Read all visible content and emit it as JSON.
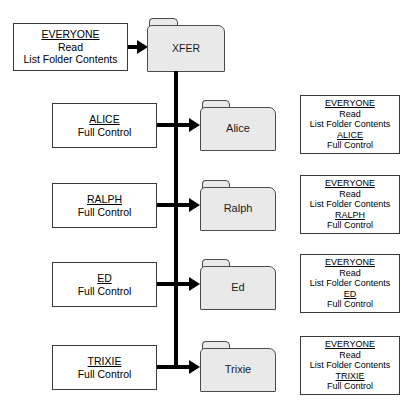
{
  "diagram": {
    "root": {
      "folder_label": "XFER",
      "permissions": {
        "lines": [
          {
            "text": "EVERYONE",
            "underline": true
          },
          {
            "text": "Read",
            "underline": false
          },
          {
            "text": "List Folder Contents",
            "underline": false
          }
        ]
      }
    },
    "rows": [
      {
        "folder_label": "Alice",
        "assigned": {
          "lines": [
            {
              "text": "ALICE",
              "underline": true
            },
            {
              "text": "Full Control",
              "underline": false
            }
          ]
        },
        "effective": {
          "lines": [
            {
              "text": "EVERYONE",
              "underline": true
            },
            {
              "text": "Read",
              "underline": false
            },
            {
              "text": "List Folder Contents",
              "underline": false
            },
            {
              "text": "ALICE",
              "underline": true
            },
            {
              "text": "Full Control",
              "underline": false
            }
          ]
        }
      },
      {
        "folder_label": "Ralph",
        "assigned": {
          "lines": [
            {
              "text": "RALPH",
              "underline": true
            },
            {
              "text": "Full Control",
              "underline": false
            }
          ]
        },
        "effective": {
          "lines": [
            {
              "text": "EVERYONE",
              "underline": true
            },
            {
              "text": "Read",
              "underline": false
            },
            {
              "text": "List Folder Contents",
              "underline": false
            },
            {
              "text": "RALPH",
              "underline": true
            },
            {
              "text": "Full Control",
              "underline": false
            }
          ]
        }
      },
      {
        "folder_label": "Ed",
        "assigned": {
          "lines": [
            {
              "text": "ED",
              "underline": true
            },
            {
              "text": "Full Control",
              "underline": false
            }
          ]
        },
        "effective": {
          "lines": [
            {
              "text": "EVERYONE",
              "underline": true
            },
            {
              "text": "Read",
              "underline": false
            },
            {
              "text": "List Folder Contents",
              "underline": false
            },
            {
              "text": "ED",
              "underline": true
            },
            {
              "text": "Full Control",
              "underline": false
            }
          ]
        }
      },
      {
        "folder_label": "Trixie",
        "assigned": {
          "lines": [
            {
              "text": "TRIXIE",
              "underline": true
            },
            {
              "text": "Full Control",
              "underline": false
            }
          ]
        },
        "effective": {
          "lines": [
            {
              "text": "EVERYONE",
              "underline": true
            },
            {
              "text": "Read",
              "underline": false
            },
            {
              "text": "List Folder Contents",
              "underline": false
            },
            {
              "text": "TRIXIE",
              "underline": true
            },
            {
              "text": "Full Control",
              "underline": false
            }
          ]
        }
      }
    ],
    "colors": {
      "folder_fill": "#e9e9e9",
      "folder_stroke": "#4a4a4a",
      "box_stroke": "#3a3a3a",
      "connector": "#000000",
      "background": "#ffffff",
      "text": "#000000"
    }
  }
}
